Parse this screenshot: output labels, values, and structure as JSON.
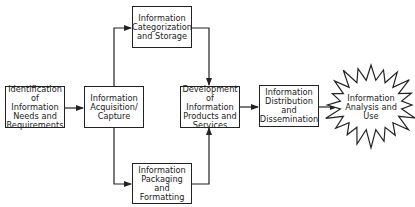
{
  "diagram": {
    "nodes": [
      {
        "id": "identification",
        "label": "Identification of Information Needs and Requirements",
        "lines": [
          "Identification",
          "of Information",
          "Needs and",
          "Requirements"
        ]
      },
      {
        "id": "acquisition",
        "label": "Information Acquisition/ Capture",
        "lines": [
          "Information",
          "Acquisition/",
          "Capture"
        ]
      },
      {
        "id": "categorization",
        "label": "Information Categorization and Storage",
        "lines": [
          "Information",
          "Categorization",
          "and Storage"
        ]
      },
      {
        "id": "packaging",
        "label": "Information Packaging and Formatting",
        "lines": [
          "Information",
          "Packaging and",
          "Formatting"
        ]
      },
      {
        "id": "development",
        "label": "Development of Information Products and Services",
        "lines": [
          "Development",
          "of Information",
          "Products and",
          "Services"
        ]
      },
      {
        "id": "distribution",
        "label": "Information Distribution and Dissemination",
        "lines": [
          "Information",
          "Distribution",
          "and",
          "Dissemination"
        ]
      },
      {
        "id": "analysis",
        "label": "Information Analysis and Use",
        "lines": [
          "Information",
          "Analysis and",
          "Use"
        ],
        "shape": "starburst"
      }
    ],
    "edges": [
      {
        "from": "identification",
        "to": "acquisition"
      },
      {
        "from": "acquisition",
        "to": "categorization"
      },
      {
        "from": "acquisition",
        "to": "packaging"
      },
      {
        "from": "categorization",
        "to": "development"
      },
      {
        "from": "packaging",
        "to": "development"
      },
      {
        "from": "development",
        "to": "distribution"
      },
      {
        "from": "distribution",
        "to": "analysis"
      }
    ],
    "colors": {
      "stroke": "#222222",
      "background": "#ffffff",
      "text": "#222222"
    }
  }
}
